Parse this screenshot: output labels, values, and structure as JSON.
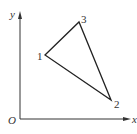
{
  "diagram": {
    "axes": {
      "x_label": "x",
      "y_label": "y",
      "origin_label": "O"
    },
    "points": [
      {
        "id": "1",
        "label": "1",
        "x": 45,
        "y": 55
      },
      {
        "id": "2",
        "label": "2",
        "x": 111,
        "y": 100
      },
      {
        "id": "3",
        "label": "3",
        "x": 79,
        "y": 22
      }
    ],
    "edges": [
      [
        "1",
        "3"
      ],
      [
        "3",
        "2"
      ],
      [
        "2",
        "1"
      ]
    ],
    "colors": {
      "line": "#222222",
      "axis": "#333333",
      "background": "#ffffff"
    }
  }
}
